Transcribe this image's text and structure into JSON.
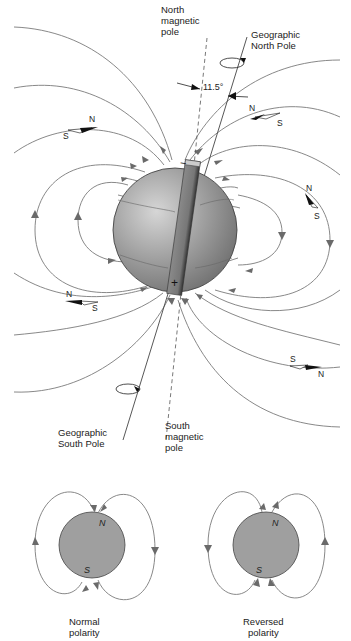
{
  "labels": {
    "north_magnetic_pole": "North\nmagnetic\npole",
    "geographic_north_pole": "Geographic\nNorth Pole",
    "angle": "11.5°",
    "geographic_south_pole": "Geographic\nSouth Pole",
    "south_magnetic_pole": "South\nmagnetic\npole"
  },
  "bar_magnet": {
    "top_sign": "−",
    "bottom_sign": "+"
  },
  "compasses": [
    {
      "n": "N",
      "s": "S"
    },
    {
      "n": "N",
      "s": "S"
    },
    {
      "n": "N",
      "s": "S"
    },
    {
      "n": "N",
      "s": "S"
    },
    {
      "n": "N",
      "s": "S"
    }
  ],
  "insets": {
    "normal": {
      "n": "N",
      "s": "S",
      "caption": "Normal\npolarity"
    },
    "reversed": {
      "n": "N",
      "s": "S",
      "caption": "Reversed\npolarity"
    }
  },
  "colors": {
    "sphere": "#9a9a9a",
    "lines": "#7a7a7a",
    "background": "#ffffff"
  }
}
